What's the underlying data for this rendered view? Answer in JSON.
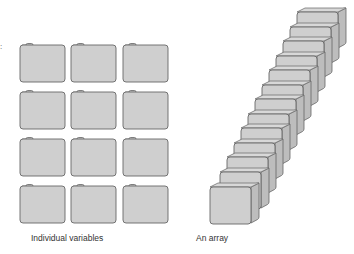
{
  "figure": {
    "left_panel": {
      "label": "Individual  variables",
      "rows": 4,
      "cols": 3,
      "box_color": "#cfcfcf",
      "border_color": "#666666"
    },
    "right_panel": {
      "label": "An array",
      "count": 13,
      "box_color": "#cfcfcf",
      "border_color": "#666666"
    },
    "stray_mark": ":"
  }
}
